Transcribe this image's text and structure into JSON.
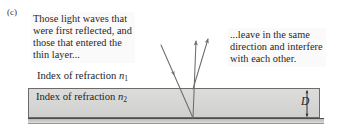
{
  "figure": {
    "panel_label": "(c)",
    "background_color": "#ffffff"
  },
  "callouts": {
    "left": {
      "lines": [
        "Those light waves that",
        "were first reflected, and",
        "those that entered the",
        "thin layer..."
      ]
    },
    "right": {
      "lines": [
        "...leave in the same",
        "direction and interfere",
        "with each other."
      ]
    }
  },
  "labels": {
    "n1": {
      "text": "Index of refraction ",
      "symbol": "n",
      "subscript": "1"
    },
    "n2": {
      "text": "Index of refraction ",
      "symbol": "n",
      "subscript": "2"
    },
    "thickness": "D"
  },
  "colors": {
    "slab_fill": "#d6d6d4",
    "slab_border": "#6d6a68",
    "substrate_fill": "#cdcdcb",
    "ray_stroke": "#6f6c6a",
    "text": "#241f1f",
    "callout_bg": "#fbfafa"
  },
  "rays": {
    "incident": {
      "x1": 161,
      "y1": 45,
      "x2": 193,
      "y2": 118
    },
    "reflected_primary": {
      "x1": 177,
      "y1": 89,
      "x2": 196,
      "y2": 41
    },
    "reflected_secondary": {
      "x1": 193,
      "y1": 90,
      "x2": 208,
      "y2": 39
    }
  }
}
